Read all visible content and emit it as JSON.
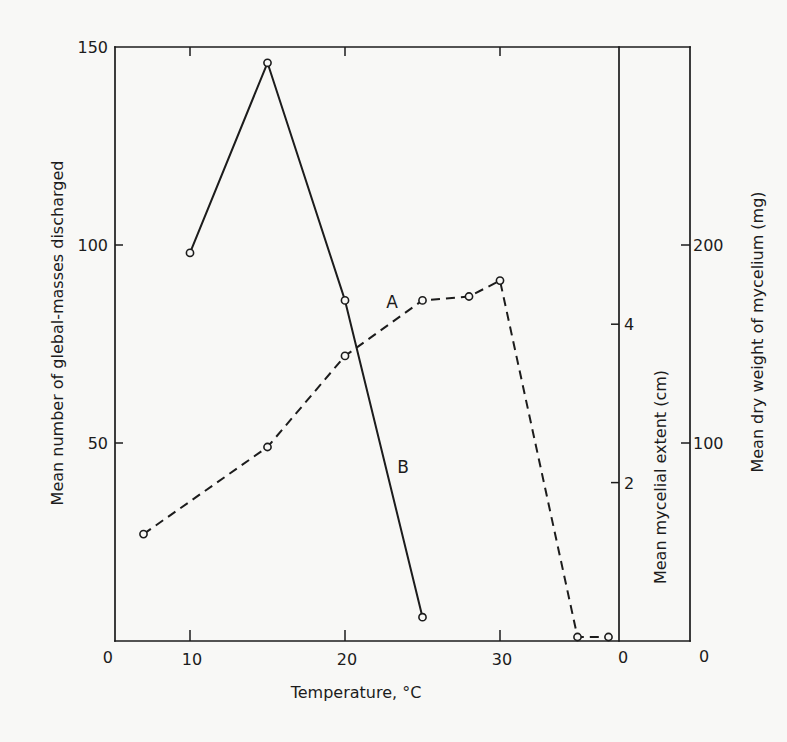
{
  "chart_data": {
    "type": "line",
    "title": "",
    "xlabel": "Temperature, °C",
    "ylabel": "Mean number of glebal-masses discharged",
    "ylabel_right_inner": "Mean mycelial extent (cm)",
    "ylabel_right_outer": "Mean dry weight of mycelium (mg)",
    "x_ticks": [
      10,
      20,
      30
    ],
    "y_ticks": [
      0,
      50,
      100,
      150
    ],
    "y_right_inner_ticks": [
      0,
      2,
      4
    ],
    "y_right_outer_ticks": [
      0,
      100,
      200
    ],
    "xlim": [
      5.5,
      37.7
    ],
    "ylim": [
      0,
      150
    ],
    "ylim_right_inner": [
      0,
      7.5
    ],
    "ylim_right_outer": [
      0,
      300
    ],
    "grid": false,
    "legend": "inline curve labels A and B",
    "series": [
      {
        "name": "A",
        "style": "dashed",
        "marker": "open-circle",
        "x": [
          7,
          15,
          20,
          25,
          28,
          30,
          35,
          37
        ],
        "y": [
          27,
          49,
          72,
          86,
          87,
          91,
          1,
          1
        ]
      },
      {
        "name": "B",
        "style": "solid",
        "marker": "open-circle",
        "x": [
          10,
          15,
          20,
          25
        ],
        "y": [
          98,
          146,
          86,
          6
        ]
      }
    ]
  }
}
